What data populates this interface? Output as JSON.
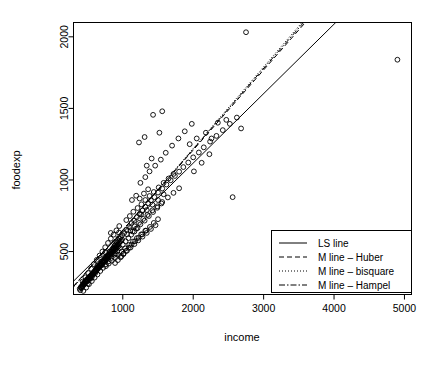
{
  "chart_data": {
    "type": "scatter",
    "title": "",
    "subtitle": "",
    "xlabel": "income",
    "ylabel": "foodexp",
    "xlim": [
      300,
      5100
    ],
    "ylim": [
      200,
      2100
    ],
    "xticks": [
      1000,
      2000,
      3000,
      4000,
      5000
    ],
    "xtick_labels": [
      "1000",
      "2000",
      "3000",
      "4000",
      "5000"
    ],
    "yticks": [
      500,
      1000,
      1500,
      2000
    ],
    "ytick_labels": [
      "500",
      "1000",
      "1500",
      "2000"
    ],
    "grid": false,
    "marker": "open-circle",
    "legend_position": "bottom-right",
    "legend": [
      {
        "label": "LS line",
        "style": "solid"
      },
      {
        "label": "M line – Huber",
        "style": "dashed"
      },
      {
        "label": "M line – bisquare",
        "style": "dotted"
      },
      {
        "label": "M line – Hampel",
        "style": "dashdot"
      }
    ],
    "series": [
      {
        "name": "Engel food expenditure",
        "type": "scatter",
        "points": [
          [
            420,
            256
          ],
          [
            541,
            310
          ],
          [
            901,
            485
          ],
          [
            639,
            402
          ],
          [
            751,
            495
          ],
          [
            946,
            633
          ],
          [
            830,
            630
          ],
          [
            502,
            275
          ],
          [
            972,
            600
          ],
          [
            687,
            403
          ],
          [
            561,
            322
          ],
          [
            608,
            349
          ],
          [
            634,
            385
          ],
          [
            482,
            290
          ],
          [
            454,
            273
          ],
          [
            490,
            292
          ],
          [
            527,
            310
          ],
          [
            575,
            339
          ],
          [
            612,
            367
          ],
          [
            658,
            392
          ],
          [
            700,
            430
          ],
          [
            742,
            455
          ],
          [
            781,
            470
          ],
          [
            812,
            500
          ],
          [
            858,
            522
          ],
          [
            883,
            540
          ],
          [
            910,
            570
          ],
          [
            932,
            580
          ],
          [
            388,
            240
          ],
          [
            404,
            252
          ],
          [
            432,
            268
          ],
          [
            448,
            282
          ],
          [
            462,
            288
          ],
          [
            478,
            300
          ],
          [
            495,
            306
          ],
          [
            512,
            318
          ],
          [
            530,
            325
          ],
          [
            548,
            334
          ],
          [
            566,
            346
          ],
          [
            584,
            352
          ],
          [
            600,
            362
          ],
          [
            620,
            376
          ],
          [
            644,
            390
          ],
          [
            666,
            405
          ],
          [
            690,
            418
          ],
          [
            710,
            432
          ],
          [
            730,
            440
          ],
          [
            760,
            462
          ],
          [
            790,
            478
          ],
          [
            822,
            496
          ],
          [
            846,
            512
          ],
          [
            872,
            528
          ],
          [
            896,
            548
          ],
          [
            920,
            562
          ],
          [
            955,
            590
          ],
          [
            990,
            614
          ],
          [
            1020,
            630
          ],
          [
            1055,
            652
          ],
          [
            1090,
            670
          ],
          [
            1125,
            700
          ],
          [
            1160,
            715
          ],
          [
            1200,
            740
          ],
          [
            1240,
            762
          ],
          [
            1280,
            786
          ],
          [
            1320,
            812
          ],
          [
            1360,
            838
          ],
          [
            1400,
            858
          ],
          [
            1450,
            880
          ],
          [
            1500,
            912
          ],
          [
            1560,
            940
          ],
          [
            1620,
            968
          ],
          [
            1680,
            998
          ],
          [
            1740,
            1028
          ],
          [
            1800,
            1058
          ],
          [
            1860,
            1090
          ],
          [
            1930,
            1122
          ],
          [
            2000,
            1158
          ],
          [
            2080,
            1192
          ],
          [
            2150,
            1228
          ],
          [
            2240,
            1268
          ],
          [
            2330,
            1308
          ],
          [
            2420,
            1348
          ],
          [
            2520,
            1392
          ],
          [
            2620,
            1436
          ],
          [
            410,
            250
          ],
          [
            425,
            262
          ],
          [
            440,
            270
          ],
          [
            455,
            280
          ],
          [
            470,
            288
          ],
          [
            485,
            296
          ],
          [
            500,
            304
          ],
          [
            515,
            312
          ],
          [
            528,
            320
          ],
          [
            542,
            328
          ],
          [
            556,
            336
          ],
          [
            570,
            344
          ],
          [
            585,
            352
          ],
          [
            598,
            360
          ],
          [
            612,
            368
          ],
          [
            626,
            376
          ],
          [
            640,
            384
          ],
          [
            654,
            392
          ],
          [
            668,
            400
          ],
          [
            682,
            408
          ],
          [
            696,
            416
          ],
          [
            710,
            424
          ],
          [
            724,
            432
          ],
          [
            738,
            440
          ],
          [
            752,
            448
          ],
          [
            766,
            456
          ],
          [
            780,
            464
          ],
          [
            794,
            472
          ],
          [
            808,
            480
          ],
          [
            822,
            488
          ],
          [
            836,
            496
          ],
          [
            850,
            504
          ],
          [
            864,
            512
          ],
          [
            878,
            520
          ],
          [
            892,
            528
          ],
          [
            906,
            536
          ],
          [
            920,
            544
          ],
          [
            934,
            552
          ],
          [
            948,
            560
          ],
          [
            962,
            568
          ],
          [
            976,
            576
          ],
          [
            990,
            584
          ],
          [
            396,
            230
          ],
          [
            412,
            244
          ],
          [
            428,
            256
          ],
          [
            444,
            266
          ],
          [
            460,
            276
          ],
          [
            476,
            286
          ],
          [
            492,
            294
          ],
          [
            508,
            302
          ],
          [
            524,
            312
          ],
          [
            540,
            320
          ],
          [
            556,
            330
          ],
          [
            572,
            340
          ],
          [
            588,
            348
          ],
          [
            604,
            356
          ],
          [
            620,
            366
          ],
          [
            636,
            374
          ],
          [
            652,
            382
          ],
          [
            668,
            392
          ],
          [
            684,
            400
          ],
          [
            700,
            408
          ],
          [
            716,
            418
          ],
          [
            732,
            426
          ],
          [
            748,
            434
          ],
          [
            764,
            444
          ],
          [
            780,
            452
          ],
          [
            796,
            460
          ],
          [
            812,
            470
          ],
          [
            828,
            478
          ],
          [
            844,
            486
          ],
          [
            860,
            496
          ],
          [
            876,
            504
          ],
          [
            892,
            512
          ],
          [
            908,
            522
          ],
          [
            924,
            530
          ],
          [
            940,
            538
          ],
          [
            430,
            290
          ],
          [
            470,
            320
          ],
          [
            510,
            350
          ],
          [
            550,
            380
          ],
          [
            590,
            412
          ],
          [
            630,
            442
          ],
          [
            670,
            472
          ],
          [
            710,
            500
          ],
          [
            750,
            530
          ],
          [
            790,
            560
          ],
          [
            830,
            590
          ],
          [
            870,
            618
          ],
          [
            910,
            648
          ],
          [
            950,
            678
          ],
          [
            440,
            225
          ],
          [
            480,
            248
          ],
          [
            520,
            272
          ],
          [
            560,
            294
          ],
          [
            600,
            318
          ],
          [
            640,
            340
          ],
          [
            680,
            364
          ],
          [
            720,
            386
          ],
          [
            760,
            410
          ],
          [
            800,
            432
          ],
          [
            840,
            456
          ],
          [
            880,
            478
          ],
          [
            920,
            502
          ],
          [
            960,
            524
          ],
          [
            1000,
            548
          ],
          [
            1040,
            572
          ],
          [
            1080,
            594
          ],
          [
            1120,
            618
          ],
          [
            1165,
            640
          ],
          [
            1210,
            664
          ],
          [
            1050,
            720
          ],
          [
            1100,
            748
          ],
          [
            1150,
            778
          ],
          [
            1210,
            804
          ],
          [
            1265,
            830
          ],
          [
            1320,
            860
          ],
          [
            1380,
            888
          ],
          [
            1440,
            916
          ],
          [
            1510,
            948
          ],
          [
            1580,
            980
          ],
          [
            1650,
            1010
          ],
          [
            1720,
            1042
          ],
          [
            1060,
            620
          ],
          [
            1110,
            648
          ],
          [
            1170,
            676
          ],
          [
            1230,
            700
          ],
          [
            1290,
            728
          ],
          [
            1350,
            756
          ],
          [
            1420,
            788
          ],
          [
            1490,
            816
          ],
          [
            1560,
            846
          ],
          [
            1640,
            878
          ],
          [
            1720,
            910
          ],
          [
            1800,
            942
          ],
          [
            1250,
            980
          ],
          [
            1320,
            1020
          ],
          [
            1380,
            1060
          ],
          [
            1460,
            1100
          ],
          [
            1540,
            1142
          ],
          [
            1610,
            1190
          ],
          [
            1700,
            1240
          ],
          [
            1790,
            1290
          ],
          [
            1880,
            1340
          ],
          [
            1980,
            1392
          ],
          [
            1230,
            1262
          ],
          [
            1310,
            1300
          ],
          [
            1520,
            1330
          ],
          [
            1430,
            1455
          ],
          [
            1560,
            1480
          ],
          [
            1340,
            1100
          ],
          [
            1410,
            1150
          ],
          [
            1950,
            1250
          ],
          [
            2050,
            1290
          ],
          [
            2180,
            1330
          ],
          [
            2350,
            1400
          ],
          [
            2470,
            1420
          ],
          [
            2010,
            1060
          ],
          [
            2120,
            1120
          ],
          [
            2230,
            1180
          ],
          [
            1130,
            860
          ],
          [
            1190,
            890
          ],
          [
            1240,
            870
          ],
          [
            1300,
            905
          ],
          [
            1360,
            935
          ],
          [
            1260,
            760
          ],
          [
            1340,
            790
          ],
          [
            1420,
            828
          ],
          [
            1500,
            860
          ],
          [
            1580,
            900
          ],
          [
            1140,
            640
          ],
          [
            1190,
            660
          ],
          [
            1250,
            690
          ],
          [
            1310,
            716
          ],
          [
            1370,
            748
          ],
          [
            1430,
            776
          ],
          [
            1490,
            806
          ],
          [
            1550,
            836
          ],
          [
            980,
            468
          ],
          [
            1010,
            486
          ],
          [
            1045,
            504
          ],
          [
            1085,
            526
          ],
          [
            1125,
            548
          ],
          [
            1175,
            572
          ],
          [
            1225,
            596
          ],
          [
            1275,
            620
          ],
          [
            1330,
            646
          ],
          [
            1385,
            672
          ],
          [
            1440,
            700
          ],
          [
            1500,
            726
          ],
          [
            890,
            420
          ],
          [
            930,
            440
          ],
          [
            970,
            460
          ],
          [
            1010,
            482
          ],
          [
            1060,
            506
          ],
          [
            1110,
            528
          ],
          [
            1165,
            552
          ],
          [
            1220,
            578
          ],
          [
            1280,
            604
          ],
          [
            1340,
            630
          ],
          [
            1400,
            658
          ],
          [
            1465,
            684
          ],
          [
            760,
            398
          ],
          [
            800,
            416
          ],
          [
            845,
            436
          ],
          [
            890,
            456
          ],
          [
            935,
            478
          ],
          [
            985,
            500
          ],
          [
            1035,
            522
          ],
          [
            1090,
            546
          ],
          [
            1145,
            570
          ],
          [
            1200,
            594
          ],
          [
            1260,
            620
          ],
          [
            1320,
            646
          ],
          [
            2750,
            2032
          ],
          [
            4900,
            1840
          ],
          [
            2560,
            880
          ],
          [
            2260,
            1290
          ],
          [
            2680,
            1360
          ]
        ]
      }
    ],
    "fits": [
      {
        "name": "LS line",
        "style": "solid",
        "slope": 0.4852,
        "intercept": 147.5
      },
      {
        "name": "M line – Huber",
        "style": "dashed",
        "slope": 0.5595,
        "intercept": 90.0
      },
      {
        "name": "M line – bisquare",
        "style": "dotted",
        "slope": 0.57,
        "intercept": 80.0
      },
      {
        "name": "M line – Hampel",
        "style": "dashdot",
        "slope": 0.5648,
        "intercept": 85.0
      }
    ],
    "colors": {
      "foreground": "#000000",
      "background": "#ffffff"
    }
  }
}
